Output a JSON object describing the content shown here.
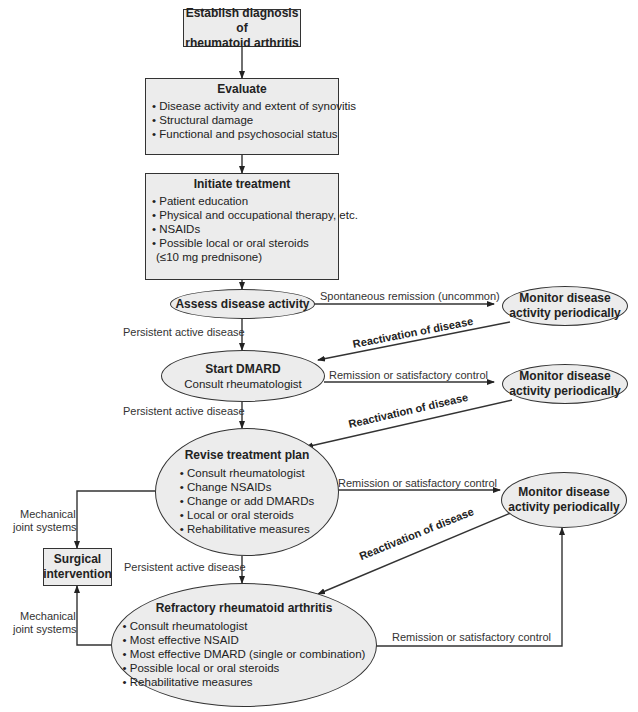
{
  "nodes": {
    "diagnosis": {
      "title": "Establish diagnosis of rheumatoid arthritis",
      "line1": "Establish diagnosis of",
      "line2": "rheumatoid arthritis"
    },
    "evaluate": {
      "title": "Evaluate",
      "items": [
        "Disease activity and extent of synovitis",
        "Structural damage",
        "Functional and psychosocial status"
      ]
    },
    "initiate": {
      "title": "Initiate treatment",
      "items": [
        "Patient education",
        "Physical and occupational therapy, etc.",
        "NSAIDs",
        "Possible local or oral steroids",
        "(≤10 mg prednisone)"
      ]
    },
    "assess": {
      "title": "Assess disease activity"
    },
    "start_dmard": {
      "title": "Start DMARD",
      "subtitle": "Consult rheumatologist"
    },
    "revise": {
      "title": "Revise treatment plan",
      "items": [
        "Consult rheumatologist",
        "Change NSAIDs",
        "Change or add DMARDs",
        "Local or oral steroids",
        "Rehabilitative measures"
      ]
    },
    "refractory": {
      "title": "Refractory rheumatoid arthritis",
      "items": [
        "Consult rheumatologist",
        "Most effective NSAID",
        "Most effective DMARD (single or combination)",
        "Possible local or oral steroids",
        "Rehabilitative measures"
      ]
    },
    "surgical": {
      "line1": "Surgical",
      "line2": "intervention"
    },
    "monitor1": {
      "line1": "Monitor disease",
      "line2": "activity periodically"
    },
    "monitor2": {
      "line1": "Monitor disease",
      "line2": "activity periodically"
    },
    "monitor3": {
      "line1": "Monitor disease",
      "line2": "activity periodically"
    }
  },
  "edges": {
    "spontaneous": "Spontaneous remission (uncommon)",
    "persistent1": "Persistent active disease",
    "persistent2": "Persistent active disease",
    "persistent3": "Persistent active disease",
    "remission1": "Remission or satisfactory control",
    "remission2": "Remission or satisfactory control",
    "remission3": "Remission or satisfactory control",
    "reactivation1": "Reactivation of disease",
    "reactivation2": "Reactivation of disease",
    "reactivation3": "Reactivation of disease",
    "mechanical1_a": "Mechanical",
    "mechanical1_b": "joint systems",
    "mechanical2_a": "Mechanical",
    "mechanical2_b": "joint systems"
  }
}
